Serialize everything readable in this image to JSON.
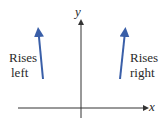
{
  "diagram": {
    "axes": {
      "x_label": "x",
      "y_label": "y"
    },
    "left_label": {
      "line1": "Rises",
      "line2": "left"
    },
    "right_label": {
      "line1": "Rises",
      "line2": "right"
    },
    "colors": {
      "arrow": "#3a5fa8",
      "axis": "#333333"
    }
  }
}
